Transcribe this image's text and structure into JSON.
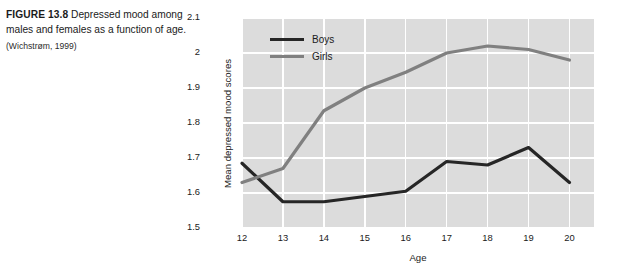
{
  "caption": {
    "label": "FIGURE 13.8",
    "text": "Depressed mood among males and females as a function of age.",
    "source": "(Wichstrøm, 1999)"
  },
  "colors": {
    "boys_line": "#262626",
    "girls_line": "#808080",
    "plot_background": "#dcdcdc",
    "gridline": "#ffffff"
  },
  "chart_data": {
    "type": "line",
    "title": "",
    "xlabel": "Age",
    "ylabel": "Mean depressed mood scores",
    "x": [
      12,
      13,
      14,
      15,
      16,
      17,
      18,
      19,
      20
    ],
    "xtick_labels": [
      "12",
      "13",
      "14",
      "15",
      "16",
      "17",
      "18",
      "19",
      "20"
    ],
    "ytick_labels": [
      "2.1",
      "2",
      "1.9",
      "1.8",
      "1.7",
      "1.6",
      "1.5"
    ],
    "yticks": [
      2.1,
      2.0,
      1.9,
      1.8,
      1.7,
      1.6,
      1.5
    ],
    "xlim": [
      12,
      20.6
    ],
    "ylim": [
      1.5,
      2.1
    ],
    "grid": true,
    "legend_position": "top-left-inside",
    "series": [
      {
        "name": "Boys",
        "color": "#262626",
        "values": [
          1.685,
          1.575,
          1.575,
          1.59,
          1.605,
          1.69,
          1.68,
          1.73,
          1.63
        ]
      },
      {
        "name": "Girls",
        "color": "#808080",
        "values": [
          1.63,
          1.67,
          1.835,
          1.9,
          1.945,
          2.0,
          2.02,
          2.01,
          1.98
        ]
      }
    ]
  }
}
